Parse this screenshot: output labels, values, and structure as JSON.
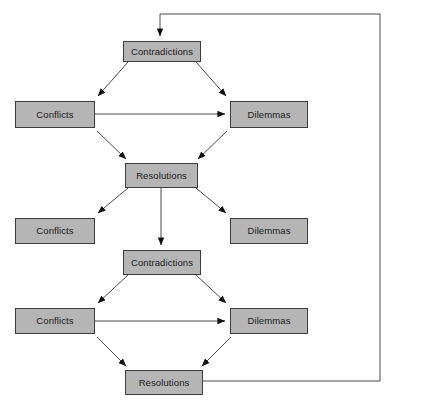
{
  "diagram": {
    "colors": {
      "node_fill": "#b5b5b5",
      "node_border": "#3d3d3d",
      "edge": "#4a4a4a",
      "background": "#ffffff",
      "text": "#1a1a1a"
    },
    "labels": {
      "contradictions": "Contradictions",
      "conflicts": "Conflicts",
      "dilemmas": "Dilemmas",
      "resolutions": "Resolutions"
    },
    "nodes": [
      {
        "id": "contradictions-1",
        "label": "Contradictions",
        "x": 123,
        "y": 41,
        "w": 78,
        "h": 21
      },
      {
        "id": "conflicts-1",
        "label": "Conflicts",
        "x": 15,
        "y": 101,
        "w": 80,
        "h": 27
      },
      {
        "id": "dilemmas-1",
        "label": "Dilemmas",
        "x": 230,
        "y": 101,
        "w": 78,
        "h": 27
      },
      {
        "id": "resolutions-1",
        "label": "Resolutions",
        "x": 125,
        "y": 163,
        "w": 73,
        "h": 25
      },
      {
        "id": "conflicts-2",
        "label": "Conflicts",
        "x": 15,
        "y": 218,
        "w": 80,
        "h": 26
      },
      {
        "id": "dilemmas-2",
        "label": "Dilemmas",
        "x": 230,
        "y": 218,
        "w": 78,
        "h": 26
      },
      {
        "id": "contradictions-2",
        "label": "Contradictions",
        "x": 123,
        "y": 250,
        "w": 78,
        "h": 25
      },
      {
        "id": "conflicts-3",
        "label": "Conflicts",
        "x": 15,
        "y": 308,
        "w": 80,
        "h": 26
      },
      {
        "id": "dilemmas-3",
        "label": "Dilemmas",
        "x": 230,
        "y": 308,
        "w": 78,
        "h": 26
      },
      {
        "id": "resolutions-2",
        "label": "Resolutions",
        "x": 125,
        "y": 370,
        "w": 78,
        "h": 25
      }
    ],
    "edges": [
      {
        "id": "feedback-loop",
        "from": "resolutions-2",
        "to": "contradictions-1",
        "kind": "orthogonal-feedback",
        "arrow": true
      },
      {
        "id": "contradictions1-to-conflicts1",
        "from": "contradictions-1",
        "to": "conflicts-1",
        "kind": "diagonal",
        "arrow": true
      },
      {
        "id": "contradictions1-to-dilemmas1",
        "from": "contradictions-1",
        "to": "dilemmas-1",
        "kind": "diagonal",
        "arrow": true
      },
      {
        "id": "conflicts1-to-dilemmas1",
        "from": "conflicts-1",
        "to": "dilemmas-1",
        "kind": "horizontal",
        "arrow": true
      },
      {
        "id": "conflicts1-to-resolutions1",
        "from": "conflicts-1",
        "to": "resolutions-1",
        "kind": "diagonal",
        "arrow": true
      },
      {
        "id": "dilemmas1-to-resolutions1",
        "from": "dilemmas-1",
        "to": "resolutions-1",
        "kind": "diagonal",
        "arrow": true
      },
      {
        "id": "resolutions1-to-conflicts2",
        "from": "resolutions-1",
        "to": "conflicts-2",
        "kind": "diagonal",
        "arrow": true
      },
      {
        "id": "resolutions1-to-dilemmas2",
        "from": "resolutions-1",
        "to": "dilemmas-2",
        "kind": "diagonal",
        "arrow": true
      },
      {
        "id": "resolutions1-to-contradictions2",
        "from": "resolutions-1",
        "to": "contradictions-2",
        "kind": "vertical",
        "arrow": true
      },
      {
        "id": "contradictions2-to-conflicts3",
        "from": "contradictions-2",
        "to": "conflicts-3",
        "kind": "diagonal",
        "arrow": true
      },
      {
        "id": "contradictions2-to-dilemmas3",
        "from": "contradictions-2",
        "to": "dilemmas-3",
        "kind": "diagonal",
        "arrow": true
      },
      {
        "id": "conflicts3-to-dilemmas3",
        "from": "conflicts-3",
        "to": "dilemmas-3",
        "kind": "horizontal",
        "arrow": true
      },
      {
        "id": "conflicts3-to-resolutions2",
        "from": "conflicts-3",
        "to": "resolutions-2",
        "kind": "diagonal",
        "arrow": true
      },
      {
        "id": "dilemmas3-to-resolutions2",
        "from": "dilemmas-3",
        "to": "resolutions-2",
        "kind": "diagonal",
        "arrow": true
      }
    ]
  }
}
